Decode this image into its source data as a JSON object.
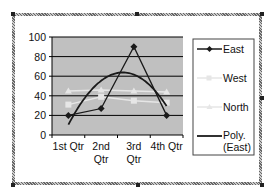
{
  "chart_data": {
    "type": "line",
    "title": "",
    "xlabel": "",
    "ylabel": "",
    "categories": [
      "1st Qtr",
      "2nd Qtr",
      "3rd Qtr",
      "4th Qtr"
    ],
    "category_lines": [
      [
        "1st Qtr"
      ],
      [
        "2nd",
        "Qtr"
      ],
      [
        "3rd",
        "Qtr"
      ],
      [
        "4th Qtr"
      ]
    ],
    "ylim": [
      0,
      100
    ],
    "yticks": [
      0,
      20,
      40,
      60,
      80,
      100
    ],
    "grid": true,
    "legend_position": "right",
    "series": [
      {
        "name": "East",
        "values": [
          20,
          27,
          90,
          20
        ],
        "color": "#1a1a1a",
        "marker": "diamond"
      },
      {
        "name": "West",
        "values": [
          31,
          39,
          35,
          33
        ],
        "color": "#e6e6e6",
        "marker": "square"
      },
      {
        "name": "North",
        "values": [
          45,
          46,
          45,
          44
        ],
        "color": "#e6e6e6",
        "marker": "triangle"
      }
    ],
    "trendline": {
      "name": "Poly. (East)",
      "of": "East",
      "type": "polynomial",
      "order": 2,
      "color": "#1a1a1a"
    },
    "legend": [
      "East",
      "West",
      "North",
      "Poly. (East)"
    ],
    "plot_background": "#c0c0c0"
  },
  "legend_labels": {
    "east": "East",
    "west": "West",
    "north": "North",
    "poly_line1": "Poly.",
    "poly_line2": "(East)"
  }
}
